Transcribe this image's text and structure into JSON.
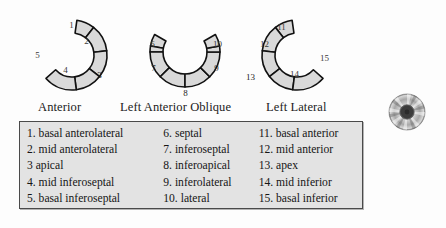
{
  "figure": {
    "title": "",
    "views": [
      {
        "id": "anterior",
        "caption": "Anterior",
        "segment_numbers": [
          "1",
          "2",
          "3",
          "4",
          "5"
        ]
      },
      {
        "id": "left-anterior-oblique",
        "caption": "Left Anterior Oblique",
        "segment_numbers": [
          "6",
          "7",
          "8",
          "9",
          "10"
        ]
      },
      {
        "id": "left-lateral",
        "caption": "Left Lateral",
        "segment_numbers": [
          "11",
          "12",
          "13",
          "14",
          "15"
        ]
      }
    ]
  },
  "legend": {
    "columns": [
      {
        "entries": [
          {
            "number": "1.",
            "label": "basal anterolateral"
          },
          {
            "number": "2.",
            "label": "mid anterolateral"
          },
          {
            "number": "3",
            "label": "apical"
          },
          {
            "number": "4.",
            "label": "mid inferoseptal"
          },
          {
            "number": "5.",
            "label": "basal inferoseptal"
          }
        ]
      },
      {
        "entries": [
          {
            "number": "6.",
            "label": "septal"
          },
          {
            "number": "7.",
            "label": "inferoseptal"
          },
          {
            "number": "8.",
            "label": "inferoapical"
          },
          {
            "number": "9.",
            "label": "inferolateral"
          },
          {
            "number": "10.",
            "label": "lateral"
          }
        ]
      },
      {
        "entries": [
          {
            "number": "11.",
            "label": "basal anterior"
          },
          {
            "number": "12.",
            "label": "mid anterior"
          },
          {
            "number": "13.",
            "label": "apex"
          },
          {
            "number": "14.",
            "label": "mid inferior"
          },
          {
            "number": "15.",
            "label": "basal inferior"
          }
        ]
      }
    ]
  },
  "icons": {
    "disc": "compact-disc-icon"
  },
  "colors": {
    "background": "#fdfdfd",
    "segment_fill": "#d9d9d9",
    "segment_stroke": "#111111",
    "legend_fill": "#e3e3e3",
    "legend_border": "#4a4a4a",
    "text": "#151515"
  }
}
